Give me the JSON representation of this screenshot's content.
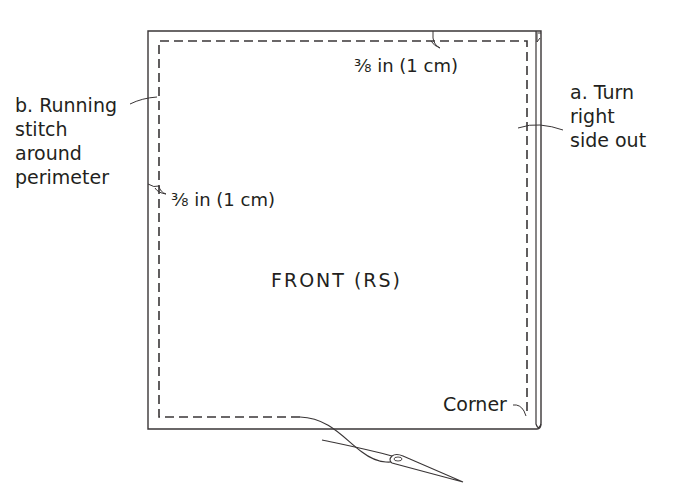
{
  "diagram": {
    "colors": {
      "line": "#3a3637",
      "text": "#231f20",
      "background": "#ffffff"
    },
    "center_label": "FRONT (RS)",
    "labels": {
      "top_seam_allowance": "⅜ in (1 cm)",
      "left_seam_allowance": "⅜ in (1 cm)",
      "step_a_line1": "a. Turn",
      "step_a_line2": "right",
      "step_a_line3": "side out",
      "step_b_line1": "b. Running",
      "step_b_line2": "stitch",
      "step_b_line3": "around",
      "step_b_line4": "perimeter",
      "corner": "Corner"
    },
    "icons": {
      "needle": "needle-with-thread-icon"
    }
  }
}
